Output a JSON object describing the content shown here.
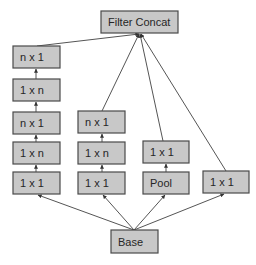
{
  "diagram": {
    "type": "inception-module",
    "colors": {
      "box_fill": "#c8c8c8",
      "box_stroke": "#4a4a4a",
      "edge": "#555555",
      "text": "#262626"
    },
    "nodes": {
      "concat": {
        "label": "Filter Concat",
        "x": 101,
        "y": 11,
        "w": 77,
        "h": 22
      },
      "base": {
        "label": "Base",
        "x": 111,
        "y": 230,
        "w": 47,
        "h": 23
      },
      "b1_l5": {
        "label": "n x 1",
        "x": 13,
        "y": 46,
        "w": 47,
        "h": 22
      },
      "b1_l4": {
        "label": "1 x n",
        "x": 13,
        "y": 79,
        "w": 47,
        "h": 22
      },
      "b1_l3": {
        "label": "n x 1",
        "x": 13,
        "y": 112,
        "w": 47,
        "h": 22
      },
      "b1_l2": {
        "label": "1 x n",
        "x": 13,
        "y": 142,
        "w": 47,
        "h": 22
      },
      "b1_l1": {
        "label": "1 x 1",
        "x": 13,
        "y": 172,
        "w": 47,
        "h": 22
      },
      "b2_l3": {
        "label": "n x 1",
        "x": 78,
        "y": 111,
        "w": 47,
        "h": 22
      },
      "b2_l2": {
        "label": "1 x n",
        "x": 78,
        "y": 142,
        "w": 47,
        "h": 22
      },
      "b2_l1": {
        "label": "1 x 1",
        "x": 78,
        "y": 172,
        "w": 47,
        "h": 22
      },
      "b3_l2": {
        "label": "1 x 1",
        "x": 143,
        "y": 141,
        "w": 46,
        "h": 22
      },
      "b3_l1": {
        "label": "Pool",
        "x": 143,
        "y": 172,
        "w": 46,
        "h": 22
      },
      "b4_l1": {
        "label": "1 x 1",
        "x": 203,
        "y": 171,
        "w": 46,
        "h": 22
      }
    },
    "edges": [
      [
        "base",
        "b1_l1"
      ],
      [
        "base",
        "b2_l1"
      ],
      [
        "base",
        "b3_l1"
      ],
      [
        "base",
        "b4_l1"
      ],
      [
        "b1_l1",
        "b1_l2"
      ],
      [
        "b1_l2",
        "b1_l3"
      ],
      [
        "b1_l3",
        "b1_l4"
      ],
      [
        "b1_l4",
        "b1_l5"
      ],
      [
        "b2_l1",
        "b2_l2"
      ],
      [
        "b2_l2",
        "b2_l3"
      ],
      [
        "b3_l1",
        "b3_l2"
      ],
      [
        "b1_l5",
        "concat"
      ],
      [
        "b2_l3",
        "concat"
      ],
      [
        "b3_l2",
        "concat"
      ],
      [
        "b4_l1",
        "concat"
      ]
    ]
  }
}
